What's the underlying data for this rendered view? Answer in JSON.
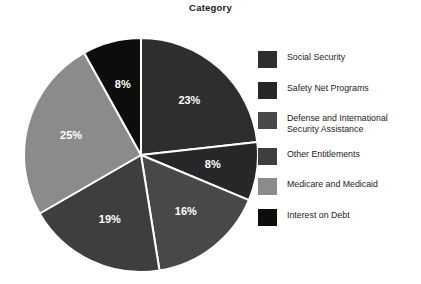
{
  "chart_data": {
    "type": "pie",
    "title": "Category",
    "xlabel": "",
    "ylabel": "",
    "legend_position": "right",
    "grid": false,
    "start_angle_deg": 0,
    "direction": "clockwise",
    "categories": [
      "Social Security",
      "Safety Net Programs",
      "Defense and International\nSecurity Assistance",
      "Other Entitlements",
      "Medicare and Medicaid",
      "Interest on Debt"
    ],
    "values": [
      23,
      8,
      16,
      19,
      25,
      8
    ],
    "labels": [
      "23%",
      "8%",
      "16%",
      "19%",
      "25%",
      "8%"
    ],
    "colors": [
      "#2e2e2e",
      "#272727",
      "#484848",
      "#3e3e3e",
      "#8b8b8b",
      "#0d0d0d"
    ],
    "slice_border_color": "#ffffff",
    "label_color": "#ffffff"
  },
  "chart": {
    "title": "Category"
  },
  "legend": {
    "items": [
      {
        "label": "Social Security",
        "color": "#2e2e2e",
        "value": "23%"
      },
      {
        "label": "Safety Net Programs",
        "color": "#272727",
        "value": "8%"
      },
      {
        "label": "Defense and International\nSecurity Assistance",
        "color": "#484848",
        "value": "16%"
      },
      {
        "label": "Other Entitlements",
        "color": "#3e3e3e",
        "value": "19%"
      },
      {
        "label": "Medicare and Medicaid",
        "color": "#8b8b8b",
        "value": "25%"
      },
      {
        "label": "Interest on Debt",
        "color": "#0d0d0d",
        "value": "8%"
      }
    ]
  },
  "slices": [
    {
      "label": "23%"
    },
    {
      "label": "8%"
    },
    {
      "label": "16%"
    },
    {
      "label": "19%"
    },
    {
      "label": "25%"
    },
    {
      "label": "8%"
    }
  ]
}
